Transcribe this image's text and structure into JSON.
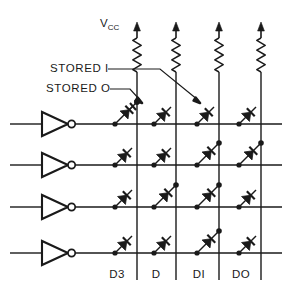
{
  "figure": {
    "type": "schematic",
    "background_color": "#ffffff",
    "line_color": "#1a1a1a",
    "text_color": "#1a1a1a"
  },
  "labels": {
    "vcc": "V",
    "vcc_subscript": "CC",
    "stored_one": "STORED I",
    "stored_zero": "STORED O"
  },
  "columns": [
    {
      "id": "col-d3",
      "label": "D3",
      "x": 137
    },
    {
      "id": "col-d2",
      "label": "D",
      "x": 176
    },
    {
      "id": "col-d1",
      "label": "DI",
      "x": 219
    },
    {
      "id": "col-d0",
      "label": "DO",
      "x": 261
    }
  ],
  "rows": [
    {
      "id": "row-0",
      "y": 124
    },
    {
      "id": "row-1",
      "y": 165
    },
    {
      "id": "row-2",
      "y": 207
    },
    {
      "id": "row-3",
      "y": 253
    }
  ],
  "matrix": {
    "note": "true = diode bridges row line to column line (stored 1); false = diode diagonal terminates open (stored 0)",
    "cells": [
      [
        true,
        false,
        false,
        false
      ],
      [
        false,
        false,
        true,
        true
      ],
      [
        false,
        true,
        true,
        false
      ],
      [
        false,
        false,
        true,
        false
      ]
    ]
  },
  "elements": {
    "inverter_count": 4,
    "resistor_count": 4,
    "supply_arrow_count": 4,
    "diode_count": 16
  },
  "annotations": [
    {
      "id": "stored-one-callout",
      "text": "STORED I",
      "text_x": 50,
      "text_y": 72,
      "leader": "M108,69 L160,69 L198,100",
      "arrow_to": {
        "x": 200,
        "y": 103
      }
    },
    {
      "id": "stored-zero-callout",
      "text": "STORED O",
      "text_x": 46,
      "text_y": 92,
      "leader": "M110,89 L130,89 L140,100",
      "arrow_to": {
        "x": 142,
        "y": 103
      }
    }
  ]
}
